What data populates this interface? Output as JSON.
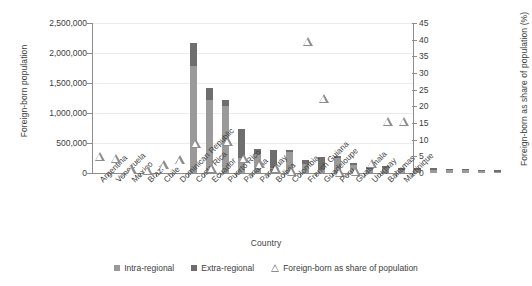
{
  "chart_data": {
    "type": "bar",
    "title": "",
    "xlabel": "Country",
    "ylabel": "Foreign-born population",
    "y2label": "Foreign-born as share of population (%)",
    "ylim": [
      0,
      2500000
    ],
    "y2lim": [
      0,
      45
    ],
    "yticks": [
      "0",
      "500,000",
      "1,000,000",
      "1,500,000",
      "2,000,000",
      "2,500,000"
    ],
    "ytick_values": [
      0,
      500000,
      1000000,
      1500000,
      2000000,
      2500000
    ],
    "y2ticks": [
      "0",
      "5",
      "10",
      "15",
      "20",
      "25",
      "30",
      "35",
      "40",
      "45"
    ],
    "y2tick_values": [
      0,
      5,
      10,
      15,
      20,
      25,
      30,
      35,
      40,
      45
    ],
    "grid": true,
    "legend_position": "bottom",
    "stacked": true,
    "categories": [
      "Argentina",
      "Venezuela",
      "Mexico",
      "Brazil",
      "Chile",
      "Dominican Republic",
      "Costa Rica",
      "Ecuador",
      "Puerto Rico",
      "Panama",
      "Paraguay",
      "Bolivia",
      "Colombia",
      "French Guiana",
      "Guadeloupe",
      "Peru",
      "Guatemala",
      "Uruguay",
      "Bahamas",
      "Martinique"
    ],
    "series": [
      {
        "name": "Intra-regional",
        "color": "#9a9a9a",
        "values": [
          1790000,
          1215000,
          1115000,
          250000,
          315000,
          90000,
          355000,
          155000,
          60000,
          255000,
          130000,
          75000,
          90000,
          45000,
          50000,
          55000,
          45000,
          45000,
          30000,
          25000
        ]
      },
      {
        "name": "Extra-regional",
        "color": "#6e6e6e",
        "values": [
          370000,
          205000,
          100000,
          480000,
          85000,
          295000,
          25000,
          65000,
          215000,
          35000,
          30000,
          25000,
          20000,
          35000,
          35000,
          30000,
          25000,
          20000,
          20000,
          25000
        ]
      },
      {
        "name": "Foreign-born as share of population",
        "type": "scatter",
        "marker": "triangle-open",
        "axis": "secondary",
        "values": [
          5.0,
          4.5,
          1.0,
          0.8,
          2.5,
          4.0,
          9.0,
          1.5,
          9.5,
          4.5,
          2.8,
          1.5,
          0.5,
          39.5,
          22.5,
          0.3,
          0.5,
          3.0,
          15.5,
          15.5
        ]
      }
    ]
  },
  "legend": {
    "items": [
      {
        "label": "Intra-regional",
        "marker": "square",
        "color": "#9a9a9a"
      },
      {
        "label": "Extra-regional",
        "marker": "square",
        "color": "#6e6e6e"
      },
      {
        "label": "Foreign-born as share of population",
        "marker": "triangle-open",
        "color": "#8d8d8d"
      }
    ]
  }
}
